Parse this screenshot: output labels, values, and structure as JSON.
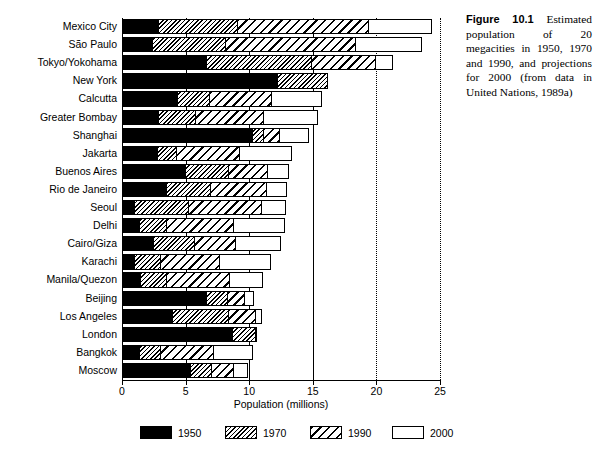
{
  "caption": {
    "figure_label": "Figure",
    "figure_number": "10.1",
    "text": "Estimated population of 20 megacities in 1950, 1970 and 1990, and projections for 2000 (from data in United Nations, 1989a)"
  },
  "chart_data": {
    "type": "bar",
    "orientation": "horizontal",
    "title": "",
    "xlabel": "Population (millions)",
    "ylabel": "",
    "xlim": [
      0,
      25
    ],
    "xticks": [
      0,
      5,
      10,
      15,
      20,
      25
    ],
    "xtick_labels": [
      "0",
      "5",
      "10",
      "15",
      "20",
      "25"
    ],
    "grid": "vertical gridlines at 5, 10, 15 (solid) and 20, 25 (dotted)",
    "legend_position": "below axis, horizontal",
    "categories": [
      "Mexico City",
      "São Paulo",
      "Tokyo/Yokohama",
      "New York",
      "Calcutta",
      "Greater Bombay",
      "Shanghai",
      "Jakarta",
      "Buenos Aires",
      "Rio de Janeiro",
      "Seoul",
      "Delhi",
      "Cairo/Giza",
      "Karachi",
      "Manila/Quezon",
      "Beijing",
      "Los Angeles",
      "London",
      "Bangkok",
      "Moscow"
    ],
    "series": [
      {
        "name": "1950",
        "pattern": "solid-black",
        "values": [
          2.9,
          2.4,
          6.7,
          12.3,
          4.4,
          2.9,
          10.3,
          2.8,
          5.0,
          3.5,
          1.0,
          1.4,
          2.5,
          1.0,
          1.5,
          6.7,
          4.0,
          8.7,
          1.4,
          5.4
        ]
      },
      {
        "name": "1970",
        "pattern": "fine-diagonal-hatch",
        "values": [
          9.1,
          8.2,
          14.9,
          16.2,
          6.9,
          5.8,
          11.2,
          4.3,
          8.4,
          7.0,
          5.3,
          3.5,
          5.7,
          3.1,
          3.5,
          8.3,
          8.4,
          10.5,
          3.1,
          7.1
        ]
      },
      {
        "name": "1990",
        "pattern": "coarse-diagonal-hatch",
        "values": [
          19.4,
          18.4,
          20.0,
          16.2,
          11.8,
          11.2,
          12.4,
          9.3,
          11.5,
          11.4,
          11.0,
          8.8,
          9.0,
          7.7,
          8.5,
          9.7,
          10.5,
          10.5,
          7.2,
          8.8
        ]
      },
      {
        "name": "2000",
        "pattern": "white-empty",
        "values": [
          24.4,
          23.6,
          21.3,
          16.2,
          15.7,
          15.4,
          14.7,
          13.4,
          13.1,
          13.0,
          12.9,
          12.8,
          12.5,
          11.7,
          11.1,
          10.4,
          11.0,
          10.6,
          10.3,
          9.9
        ]
      }
    ]
  },
  "axis": {
    "x_title": "Population (millions)"
  },
  "legend": {
    "items": [
      {
        "label": "1950",
        "swatch": "s1950"
      },
      {
        "label": "1970",
        "swatch": "s1970"
      },
      {
        "label": "1990",
        "swatch": "s1990"
      },
      {
        "label": "2000",
        "swatch": "s2000"
      }
    ]
  }
}
